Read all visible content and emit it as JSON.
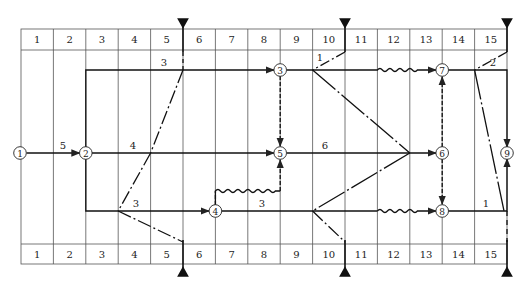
{
  "diagram": {
    "type": "time-scaled network diagram",
    "columns": [
      "1",
      "2",
      "3",
      "4",
      "5",
      "6",
      "7",
      "8",
      "9",
      "10",
      "11",
      "12",
      "13",
      "14",
      "15"
    ],
    "nodes": [
      {
        "id": "1",
        "label": "1"
      },
      {
        "id": "2",
        "label": "2"
      },
      {
        "id": "3",
        "label": "3"
      },
      {
        "id": "4",
        "label": "4"
      },
      {
        "id": "5",
        "label": "5"
      },
      {
        "id": "6",
        "label": "6"
      },
      {
        "id": "7",
        "label": "7"
      },
      {
        "id": "8",
        "label": "8"
      },
      {
        "id": "9",
        "label": "9"
      }
    ],
    "activity_labels": {
      "a12": "5",
      "a23": "3",
      "a25": "4",
      "a24": "3",
      "a56": "6",
      "a48": "3",
      "a37_float": "1",
      "a79_float": "2",
      "a89": "1"
    },
    "check_lines": [
      {
        "at_column_end": "5"
      },
      {
        "at_column_end": "10"
      },
      {
        "at_column_end": "15"
      }
    ]
  }
}
